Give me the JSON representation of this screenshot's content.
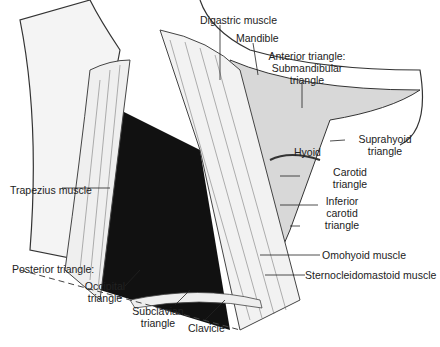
{
  "figure": {
    "labels": {
      "digastric": "Digastric muscle",
      "mandible": "Mandible",
      "anterior_1": "Anterior triangle:",
      "anterior_2": "Submandibular",
      "anterior_3": "triangle",
      "suprahyoid_1": "Suprahyoid",
      "suprahyoid_2": "triangle",
      "hyoid": "Hyoid",
      "trapezius": "Trapezius muscle",
      "carotid_1": "Carotid",
      "carotid_2": "triangle",
      "inferior_1": "Inferior",
      "inferior_2": "carotid",
      "inferior_3": "triangle",
      "omohyoid": "Omohyoid muscle",
      "scm": "Sternocleidomastoid muscle",
      "posterior": "Posterior triangle:",
      "occipital_1": "Occipital",
      "occipital_2": "triangle",
      "subclavian_1": "Subclavian",
      "subclavian_2": "triangle",
      "clavicle": "Clavicle"
    }
  }
}
